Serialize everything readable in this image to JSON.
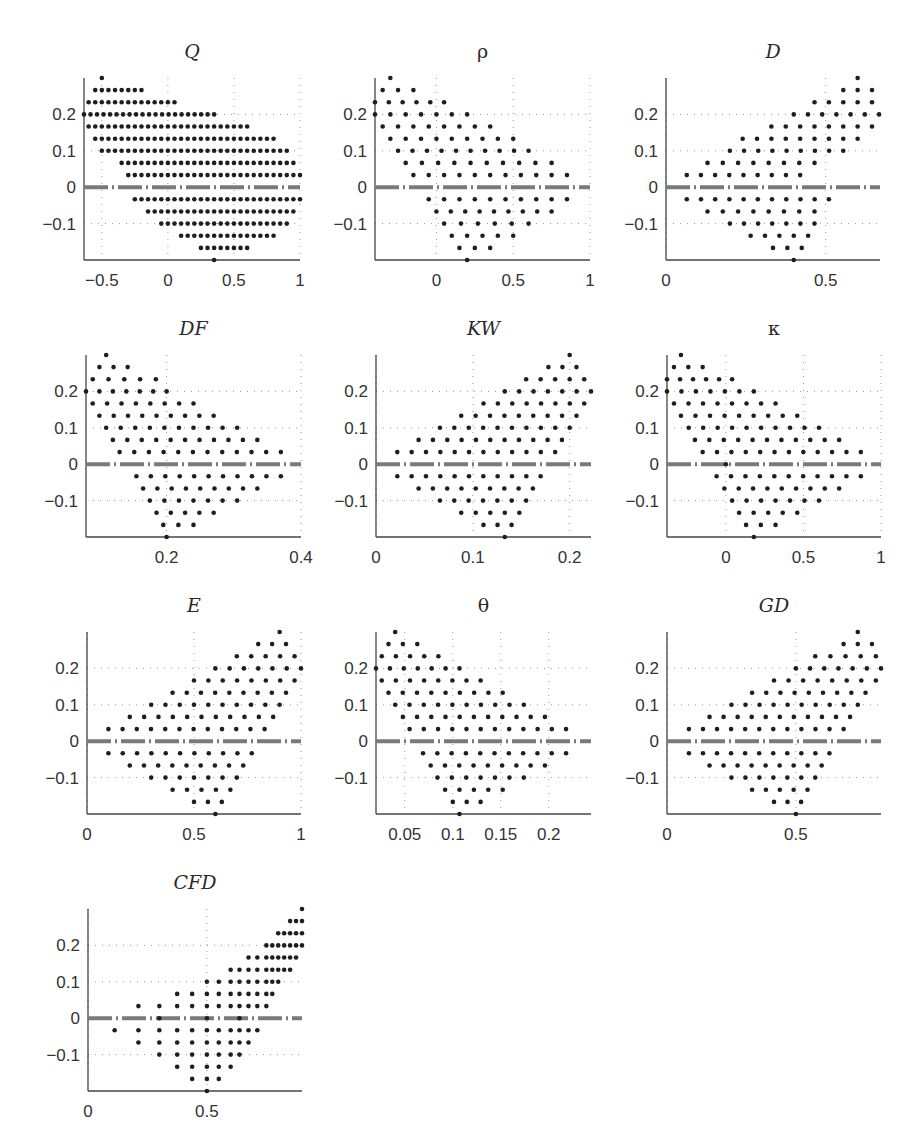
{
  "chart_data": [
    {
      "type": "scatter",
      "title": "Q",
      "italic": true,
      "xlim": [
        -0.635,
        1.0
      ],
      "ylim": [
        -0.2,
        0.3
      ],
      "xticks": [
        -0.5,
        0,
        0.5,
        1
      ],
      "xtick_labels": [
        "−0.5",
        "0",
        "0.5",
        "1"
      ],
      "yticks": [
        0.2,
        0.1,
        0,
        -0.1
      ],
      "ytick_labels": [
        "0.2",
        "0.1",
        "0",
        "−0.1"
      ],
      "step": 0.05,
      "rows": [
        [
          0.3,
          -0.5,
          -0.5
        ],
        [
          0.2667,
          -0.55,
          -0.2
        ],
        [
          0.2333,
          -0.6,
          0.05
        ],
        [
          0.2,
          -0.635,
          0.35
        ],
        [
          0.1667,
          -0.6,
          0.6
        ],
        [
          0.1333,
          -0.55,
          0.8
        ],
        [
          0.1,
          -0.5,
          0.9
        ],
        [
          0.0667,
          -0.35,
          0.95
        ],
        [
          0.0333,
          -0.3,
          1.0
        ],
        [
          -0.0333,
          -0.25,
          1.0
        ],
        [
          -0.0667,
          -0.15,
          0.95
        ],
        [
          -0.1,
          -0.05,
          0.9
        ],
        [
          -0.1333,
          0.1,
          0.8
        ],
        [
          -0.1667,
          0.25,
          0.6
        ],
        [
          -0.2,
          0.35,
          0.35
        ]
      ],
      "zero_line": true,
      "position": {
        "left": 84,
        "top": 78,
        "width": 216,
        "height": 182
      }
    },
    {
      "type": "scatter",
      "title": "ρ",
      "italic": false,
      "xlim": [
        -0.4,
        1.0
      ],
      "ylim": [
        -0.2,
        0.3
      ],
      "xticks": [
        0,
        0.5,
        1
      ],
      "xtick_labels": [
        "0",
        "0.5",
        "1"
      ],
      "yticks": [
        0.2,
        0.1,
        0,
        -0.1
      ],
      "ytick_labels": [
        "0.2",
        "0.1",
        "0",
        "−0.1"
      ],
      "step": 0.1,
      "rows": [
        [
          0.3,
          -0.3,
          -0.3
        ],
        [
          0.2667,
          -0.35,
          -0.15
        ],
        [
          0.2333,
          -0.4,
          0.05
        ],
        [
          0.2,
          -0.4,
          0.2
        ],
        [
          0.1667,
          -0.35,
          0.35
        ],
        [
          0.1333,
          -0.3,
          0.5
        ],
        [
          0.1,
          -0.25,
          0.6
        ],
        [
          0.0667,
          -0.2,
          0.75
        ],
        [
          0.0333,
          -0.15,
          0.85
        ],
        [
          -0.0333,
          -0.05,
          0.85
        ],
        [
          -0.0667,
          0.0,
          0.75
        ],
        [
          -0.1,
          0.05,
          0.6
        ],
        [
          -0.1333,
          0.1,
          0.5
        ],
        [
          -0.1667,
          0.15,
          0.35
        ],
        [
          -0.2,
          0.2,
          0.2
        ]
      ],
      "zero_line": true,
      "position": {
        "left": 375,
        "top": 78,
        "width": 215,
        "height": 182
      }
    },
    {
      "type": "scatter",
      "title": "D",
      "italic": true,
      "xlim": [
        0,
        0.67
      ],
      "ylim": [
        -0.2,
        0.3
      ],
      "xticks": [
        0,
        0.5
      ],
      "xtick_labels": [
        "0",
        "0.5"
      ],
      "yticks": [
        0.2,
        0.1,
        0,
        -0.1
      ],
      "ytick_labels": [
        "0.2",
        "0.1",
        "0",
        "−0.1"
      ],
      "step": 0.045,
      "rows": [
        [
          0.3,
          0.6,
          0.6
        ],
        [
          0.2667,
          0.555,
          0.645
        ],
        [
          0.2333,
          0.465,
          0.645
        ],
        [
          0.2,
          0.4,
          0.667
        ],
        [
          0.1667,
          0.33,
          0.645
        ],
        [
          0.1333,
          0.24,
          0.6
        ],
        [
          0.1,
          0.2,
          0.555
        ],
        [
          0.0667,
          0.13,
          0.465
        ],
        [
          0.0333,
          0.065,
          0.42
        ],
        [
          -0.0333,
          0.065,
          0.51
        ],
        [
          -0.0667,
          0.13,
          0.465
        ],
        [
          -0.1,
          0.2,
          0.465
        ],
        [
          -0.1333,
          0.265,
          0.445
        ],
        [
          -0.1667,
          0.335,
          0.425
        ],
        [
          -0.2,
          0.4,
          0.4
        ]
      ],
      "zero_line": true,
      "position": {
        "left": 666,
        "top": 78,
        "width": 214,
        "height": 182
      }
    },
    {
      "type": "scatter",
      "title": "DF",
      "italic": true,
      "xlim": [
        0.08,
        0.4
      ],
      "ylim": [
        -0.2,
        0.3
      ],
      "xticks": [
        0.2,
        0.4
      ],
      "xtick_labels": [
        "0.2",
        "0.4"
      ],
      "yticks": [
        0.2,
        0.1,
        0,
        -0.1
      ],
      "ytick_labels": [
        "0.2",
        "0.1",
        "0",
        "−0.1"
      ],
      "step": 0.021,
      "rows": [
        [
          0.3,
          0.11,
          0.11
        ],
        [
          0.2667,
          0.1,
          0.142
        ],
        [
          0.2333,
          0.09,
          0.184
        ],
        [
          0.2,
          0.08,
          0.2
        ],
        [
          0.1667,
          0.09,
          0.24
        ],
        [
          0.1333,
          0.1,
          0.27
        ],
        [
          0.1,
          0.11,
          0.305
        ],
        [
          0.0667,
          0.12,
          0.335
        ],
        [
          0.0333,
          0.13,
          0.37
        ],
        [
          -0.0333,
          0.155,
          0.37
        ],
        [
          -0.0667,
          0.165,
          0.335
        ],
        [
          -0.1,
          0.175,
          0.305
        ],
        [
          -0.1333,
          0.185,
          0.27
        ],
        [
          -0.1667,
          0.195,
          0.24
        ],
        [
          -0.2,
          0.2,
          0.2
        ]
      ],
      "zero_line": true,
      "position": {
        "left": 86,
        "top": 355,
        "width": 215,
        "height": 182
      }
    },
    {
      "type": "scatter",
      "title": "KW",
      "italic": true,
      "xlim": [
        0,
        0.222
      ],
      "ylim": [
        -0.2,
        0.3
      ],
      "xticks": [
        0,
        0.1,
        0.2
      ],
      "xtick_labels": [
        "0",
        "0.1",
        "0.2"
      ],
      "yticks": [
        0.2,
        0.1,
        0,
        -0.1
      ],
      "ytick_labels": [
        "0.2",
        "0.1",
        "0",
        "−0.1"
      ],
      "step": 0.0148,
      "rows": [
        [
          0.3,
          0.2,
          0.2
        ],
        [
          0.2667,
          0.178,
          0.207
        ],
        [
          0.2333,
          0.155,
          0.215
        ],
        [
          0.2,
          0.133,
          0.222
        ],
        [
          0.1667,
          0.111,
          0.215
        ],
        [
          0.1333,
          0.088,
          0.207
        ],
        [
          0.1,
          0.066,
          0.2
        ],
        [
          0.0667,
          0.044,
          0.192
        ],
        [
          0.0333,
          0.022,
          0.185
        ],
        [
          -0.0333,
          0.022,
          0.17
        ],
        [
          -0.0667,
          0.044,
          0.162
        ],
        [
          -0.1,
          0.066,
          0.155
        ],
        [
          -0.1333,
          0.088,
          0.148
        ],
        [
          -0.1667,
          0.111,
          0.14
        ],
        [
          -0.2,
          0.133,
          0.133
        ]
      ],
      "zero_line": true,
      "position": {
        "left": 376,
        "top": 355,
        "width": 215,
        "height": 182
      }
    },
    {
      "type": "scatter",
      "title": "κ",
      "italic": false,
      "xlim": [
        -0.38,
        1.0
      ],
      "ylim": [
        -0.2,
        0.3
      ],
      "xticks": [
        0,
        0.5,
        1
      ],
      "xtick_labels": [
        "0",
        "0.5",
        "1"
      ],
      "yticks": [
        0.2,
        0.1,
        0,
        -0.1
      ],
      "ytick_labels": [
        "0.2",
        "0.1",
        "0",
        "−0.1"
      ],
      "step": 0.093,
      "rows": [
        [
          0.3,
          -0.29,
          -0.29
        ],
        [
          0.2667,
          -0.335,
          -0.15
        ],
        [
          0.2333,
          -0.38,
          0.04
        ],
        [
          0.2,
          -0.38,
          0.18
        ],
        [
          0.1667,
          -0.335,
          0.32
        ],
        [
          0.1333,
          -0.29,
          0.46
        ],
        [
          0.1,
          -0.24,
          0.6
        ],
        [
          0.0667,
          -0.2,
          0.73
        ],
        [
          0.0333,
          -0.15,
          0.87
        ],
        [
          -0.0333,
          -0.06,
          0.87
        ],
        [
          -0.0667,
          -0.01,
          0.73
        ],
        [
          0.0,
          0.0,
          0.0
        ],
        [
          -0.1,
          0.04,
          0.6
        ],
        [
          -0.1333,
          0.085,
          0.46
        ],
        [
          -0.1667,
          0.13,
          0.32
        ],
        [
          -0.2,
          0.18,
          0.18
        ]
      ],
      "zero_line": true,
      "position": {
        "left": 667,
        "top": 355,
        "width": 214,
        "height": 182
      }
    },
    {
      "type": "scatter",
      "title": "E",
      "italic": true,
      "xlim": [
        0,
        1.0
      ],
      "ylim": [
        -0.2,
        0.3
      ],
      "xticks": [
        0,
        0.5,
        1
      ],
      "xtick_labels": [
        "0",
        "0.5",
        "1"
      ],
      "yticks": [
        0.2,
        0.1,
        0,
        -0.1
      ],
      "ytick_labels": [
        "0.2",
        "0.1",
        "0",
        "−0.1"
      ],
      "step": 0.067,
      "rows": [
        [
          0.3,
          0.9,
          0.9
        ],
        [
          0.2667,
          0.8,
          0.93
        ],
        [
          0.2333,
          0.7,
          0.97
        ],
        [
          0.2,
          0.6,
          1.0
        ],
        [
          0.1667,
          0.5,
          0.97
        ],
        [
          0.1333,
          0.4,
          0.93
        ],
        [
          0.1,
          0.3,
          0.9
        ],
        [
          0.0667,
          0.2,
          0.87
        ],
        [
          0.0333,
          0.1,
          0.83
        ],
        [
          -0.0333,
          0.1,
          0.77
        ],
        [
          -0.0667,
          0.2,
          0.73
        ],
        [
          -0.1,
          0.3,
          0.7
        ],
        [
          -0.1333,
          0.4,
          0.67
        ],
        [
          -0.1667,
          0.5,
          0.63
        ],
        [
          -0.2,
          0.6,
          0.6
        ]
      ],
      "zero_line": true,
      "position": {
        "left": 87,
        "top": 632,
        "width": 214,
        "height": 182
      }
    },
    {
      "type": "scatter",
      "title": "θ",
      "italic": false,
      "xlim": [
        0.02,
        0.244
      ],
      "ylim": [
        -0.2,
        0.3
      ],
      "xticks": [
        0.05,
        0.1,
        0.15,
        0.2
      ],
      "xtick_labels": [
        "0.05",
        "0.1",
        "0.15",
        "0.2"
      ],
      "yticks": [
        0.2,
        0.1,
        0,
        -0.1
      ],
      "ytick_labels": [
        "0.2",
        "0.1",
        "0",
        "−0.1"
      ],
      "step": 0.0148,
      "rows": [
        [
          0.3,
          0.04,
          0.04
        ],
        [
          0.2667,
          0.033,
          0.063
        ],
        [
          0.2333,
          0.026,
          0.085
        ],
        [
          0.2,
          0.02,
          0.107
        ],
        [
          0.1667,
          0.026,
          0.129
        ],
        [
          0.1333,
          0.033,
          0.152
        ],
        [
          0.1,
          0.04,
          0.174
        ],
        [
          0.0667,
          0.048,
          0.196
        ],
        [
          0.0333,
          0.055,
          0.218
        ],
        [
          -0.0333,
          0.069,
          0.218
        ],
        [
          -0.0667,
          0.077,
          0.196
        ],
        [
          -0.1,
          0.084,
          0.174
        ],
        [
          -0.1333,
          0.092,
          0.152
        ],
        [
          -0.1667,
          0.1,
          0.129
        ],
        [
          -0.2,
          0.107,
          0.107
        ]
      ],
      "zero_line": true,
      "position": {
        "left": 376,
        "top": 632,
        "width": 215,
        "height": 182
      }
    },
    {
      "type": "scatter",
      "title": "GD",
      "italic": true,
      "xlim": [
        0,
        0.83
      ],
      "ylim": [
        -0.2,
        0.3
      ],
      "xticks": [
        0,
        0.5
      ],
      "xtick_labels": [
        "0",
        "0.5"
      ],
      "yticks": [
        0.2,
        0.1,
        0,
        -0.1
      ],
      "ytick_labels": [
        "0.2",
        "0.1",
        "0",
        "−0.1"
      ],
      "step": 0.055,
      "rows": [
        [
          0.3,
          0.74,
          0.74
        ],
        [
          0.2667,
          0.685,
          0.795
        ],
        [
          0.2333,
          0.575,
          0.81
        ],
        [
          0.2,
          0.5,
          0.83
        ],
        [
          0.1667,
          0.415,
          0.81
        ],
        [
          0.1333,
          0.33,
          0.77
        ],
        [
          0.1,
          0.25,
          0.74
        ],
        [
          0.0667,
          0.165,
          0.71
        ],
        [
          0.0333,
          0.085,
          0.685
        ],
        [
          -0.0333,
          0.085,
          0.63
        ],
        [
          -0.0667,
          0.165,
          0.6
        ],
        [
          -0.1,
          0.25,
          0.575
        ],
        [
          -0.1333,
          0.33,
          0.545
        ],
        [
          -0.1667,
          0.415,
          0.52
        ],
        [
          -0.2,
          0.5,
          0.5
        ]
      ],
      "zero_line": true,
      "position": {
        "left": 667,
        "top": 632,
        "width": 214,
        "height": 182
      }
    },
    {
      "type": "scatter",
      "title": "CFD",
      "italic": true,
      "xlim": [
        0,
        0.9
      ],
      "ylim": [
        -0.2,
        0.3
      ],
      "xticks": [
        0,
        0.5
      ],
      "xtick_labels": [
        "0",
        "0.5"
      ],
      "yticks": [
        0.2,
        0.1,
        0,
        -0.1
      ],
      "ytick_labels": [
        "0.2",
        "0.1",
        "0",
        "−0.1"
      ],
      "points_rows": [
        [
          0.3,
          [
            0.9
          ]
        ],
        [
          0.2667,
          [
            0.85,
            0.875,
            0.9
          ]
        ],
        [
          0.2333,
          [
            0.8,
            0.825,
            0.85,
            0.875,
            0.9
          ]
        ],
        [
          0.2,
          [
            0.75,
            0.775,
            0.8,
            0.825,
            0.85,
            0.875,
            0.9
          ]
        ],
        [
          0.1667,
          [
            0.675,
            0.712,
            0.75,
            0.775,
            0.8,
            0.825,
            0.85,
            0.875
          ]
        ],
        [
          0.1333,
          [
            0.6,
            0.637,
            0.675,
            0.712,
            0.75,
            0.775,
            0.8,
            0.825,
            0.85
          ]
        ],
        [
          0.1,
          [
            0.5,
            0.55,
            0.6,
            0.637,
            0.675,
            0.712,
            0.75,
            0.775,
            0.8
          ]
        ],
        [
          0.0667,
          [
            0.375,
            0.438,
            0.5,
            0.55,
            0.6,
            0.637,
            0.675,
            0.712,
            0.75,
            0.775
          ]
        ],
        [
          0.0333,
          [
            0.212,
            0.3,
            0.375,
            0.438,
            0.5,
            0.55,
            0.6,
            0.637,
            0.675,
            0.712,
            0.75
          ]
        ],
        [
          0,
          [
            0.3,
            0.5,
            0.637
          ]
        ],
        [
          -0.0333,
          [
            0.112,
            0.212,
            0.3,
            0.375,
            0.438,
            0.5,
            0.55,
            0.6,
            0.637,
            0.675,
            0.712
          ]
        ],
        [
          -0.0667,
          [
            0.212,
            0.3,
            0.375,
            0.438,
            0.5,
            0.55,
            0.6,
            0.637,
            0.675
          ]
        ],
        [
          -0.1,
          [
            0.3,
            0.375,
            0.438,
            0.5,
            0.55,
            0.6,
            0.637
          ]
        ],
        [
          -0.1333,
          [
            0.375,
            0.438,
            0.5,
            0.55,
            0.6
          ]
        ],
        [
          -0.1667,
          [
            0.438,
            0.5,
            0.55
          ]
        ],
        [
          -0.2,
          [
            0.5
          ]
        ]
      ],
      "zero_line": true,
      "position": {
        "left": 88,
        "top": 909,
        "width": 214,
        "height": 182
      }
    }
  ]
}
